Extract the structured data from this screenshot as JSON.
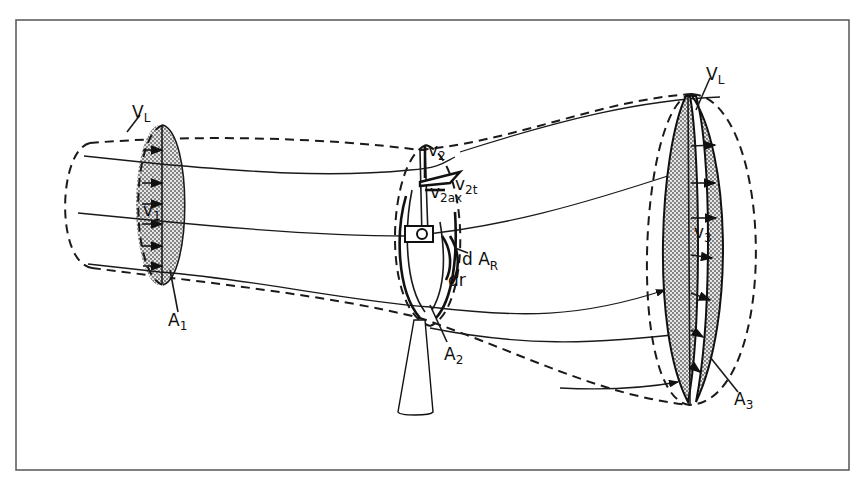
{
  "figure": {
    "frame_color": "#555555",
    "ink_color": "#1a1a1a",
    "stipple_color": "#9a9a9a"
  },
  "labels": {
    "vl_left": "V",
    "vl_left_sub": "L",
    "vl_right": "V",
    "vl_right_sub": "L",
    "v1": "v",
    "v1_sub": "1",
    "a1": "A",
    "a1_sub": "1",
    "v2": "v",
    "v2_sub": "2",
    "v2t": "v",
    "v2t_sub": "2t",
    "v2ax": "v",
    "v2ax_sub": "2ax",
    "dar": "d A",
    "dar_sub": "R",
    "dr": "dr",
    "a2": "A",
    "a2_sub": "2",
    "v3": "v",
    "v3_sub": "3",
    "a3": "A",
    "a3_sub": "3"
  }
}
